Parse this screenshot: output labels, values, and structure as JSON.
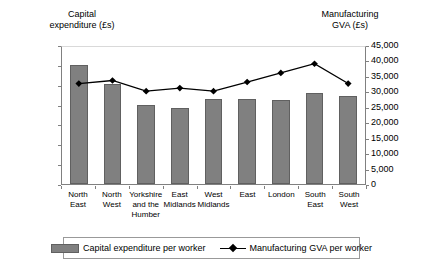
{
  "chart_data": {
    "type": "bar",
    "title": "",
    "categories": [
      "North\nEast",
      "North\nWest",
      "Yorkshire\nand the\nHumber",
      "East\nMidlands",
      "West\nMidlands",
      "East",
      "London",
      "South\nEast",
      "South\nWest"
    ],
    "series": [
      {
        "name": "Capital expenditure per worker",
        "type": "bar",
        "axis": "left",
        "color": "#808080",
        "values": [
          6000,
          5050,
          4000,
          3850,
          4300,
          4300,
          4250,
          4600,
          4450
        ]
      },
      {
        "name": "Manufacturing GVA per worker",
        "type": "line",
        "axis": "right",
        "color": "#000000",
        "marker": "diamond",
        "values": [
          33000,
          34000,
          30500,
          31500,
          30500,
          33500,
          36500,
          39500,
          33000
        ]
      }
    ],
    "xlabel": "",
    "ylabel": "Capital expenditure (£s)",
    "y2label": "Manufacturing GVA (£s)",
    "ylim": [
      0,
      7000
    ],
    "y2lim": [
      0,
      45000
    ],
    "yticks": [
      "0",
      "1,000",
      "2,000",
      "3,000",
      "4,000",
      "5,000",
      "6,000",
      "7,000"
    ],
    "y2ticks": [
      "0",
      "5,000",
      "10,000",
      "15,000",
      "20,000",
      "25,000",
      "30,000",
      "35,000",
      "40,000",
      "45,000"
    ],
    "grid": false,
    "legend_position": "bottom"
  },
  "axes": {
    "left_title": "Capital\nexpenditure (£s)",
    "right_title": "Manufacturing\nGVA (£s)"
  },
  "legend": {
    "items": [
      {
        "label": "Capital expenditure per worker",
        "icon": "bar-swatch"
      },
      {
        "label": "Manufacturing GVA per worker",
        "icon": "line-diamond-swatch"
      }
    ]
  }
}
